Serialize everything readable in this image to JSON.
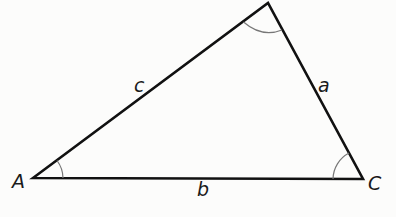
{
  "diagram": {
    "type": "triangle",
    "vertices": {
      "A": {
        "label": "A",
        "x": 33,
        "y": 178
      },
      "B": {
        "label": "",
        "x": 268,
        "y": 3
      },
      "C": {
        "label": "C",
        "x": 363,
        "y": 179
      }
    },
    "sides": {
      "a": {
        "label": "a",
        "between": [
          "B",
          "C"
        ]
      },
      "b": {
        "label": "b",
        "between": [
          "A",
          "C"
        ]
      },
      "c": {
        "label": "c",
        "between": [
          "A",
          "B"
        ]
      }
    },
    "angle_arcs": [
      "A",
      "B",
      "C"
    ],
    "colors": {
      "stroke": "#111111",
      "arc": "#777777",
      "background": "#fcfcfb"
    }
  }
}
